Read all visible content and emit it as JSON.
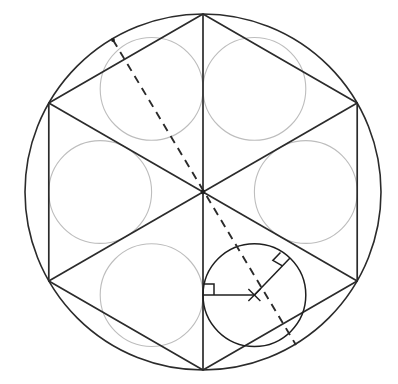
{
  "figure": {
    "domain": "Diagram",
    "canvas": {
      "width": 398,
      "height": 384,
      "background": "#ffffff"
    },
    "colors": {
      "primary_stroke": "#2b2b2b",
      "dark_stroke": "#1f1f1f",
      "light_circle_stroke": "#bdbdbd",
      "background": "#ffffff"
    }
  },
  "geometry": {
    "outer_circle": {
      "label": "outer circumscribed circle",
      "cx": 203,
      "cy": 192,
      "r": 178,
      "stroke": "#2b2b2b"
    },
    "hexagon": {
      "label": "regular hexagon inscribed in outer circle",
      "sides": 6,
      "rotation_deg": 90,
      "vertices": [
        {
          "name": "top",
          "x": 203,
          "y": 14
        },
        {
          "name": "upper-right",
          "x": 357.2,
          "y": 103
        },
        {
          "name": "lower-right",
          "x": 357.2,
          "y": 281
        },
        {
          "name": "bottom",
          "x": 203,
          "y": 370
        },
        {
          "name": "lower-left",
          "x": 48.8,
          "y": 281
        },
        {
          "name": "upper-left",
          "x": 48.8,
          "y": 103
        }
      ]
    },
    "diameters": {
      "label": "three long diagonals of hexagon meeting at center",
      "count": 3,
      "center": {
        "x": 203,
        "y": 192
      },
      "lines": [
        {
          "name": "vertical-diameter",
          "x1": 203,
          "y1": 14,
          "x2": 203,
          "y2": 370
        },
        {
          "name": "diagonal-upper-left-to-lower-right",
          "x1": 48.8,
          "y1": 103,
          "x2": 357.2,
          "y2": 281
        },
        {
          "name": "diagonal-upper-right-to-lower-left",
          "x1": 357.2,
          "y1": 103,
          "x2": 48.8,
          "y2": 281
        }
      ]
    },
    "inscribed_circles": {
      "label": "six circles inscribed in the six equilateral triangles",
      "count": 6,
      "radius": 51.4,
      "circles": [
        {
          "name": "circle-top-left",
          "cx": 151.6,
          "cy": 88.9,
          "highlight": false
        },
        {
          "name": "circle-top-right",
          "cx": 254.4,
          "cy": 88.9,
          "highlight": false
        },
        {
          "name": "circle-right",
          "cx": 305.8,
          "cy": 192,
          "highlight": false
        },
        {
          "name": "circle-bottom-right",
          "cx": 254.4,
          "cy": 295.1,
          "highlight": true
        },
        {
          "name": "circle-bottom-left",
          "cx": 151.6,
          "cy": 295.1,
          "highlight": false
        },
        {
          "name": "circle-left",
          "cx": 100.2,
          "cy": 192,
          "highlight": false
        }
      ]
    },
    "dashed_line": {
      "label": "dashed line from upper-left arc point through center to lower-right arc point",
      "x1": 113,
      "y1": 40,
      "x2": 296,
      "y2": 345,
      "dasharray": "8 6"
    },
    "radii": [
      {
        "name": "radius-horizontal-to-vertical-diameter",
        "from": {
          "x": 254.4,
          "y": 295.1
        },
        "to": {
          "x": 203,
          "y": 295.1
        },
        "note": "perpendicular to vertical diameter"
      },
      {
        "name": "radius-to-tangent-point-on-hexagon-side",
        "from": {
          "x": 254.4,
          "y": 295.1
        },
        "to": {
          "x": 290,
          "y": 258
        },
        "note": "perpendicular to hexagon diagonal at tangency"
      }
    ],
    "right_angle_marks": [
      {
        "name": "right-angle-at-vertical-diameter",
        "vertex": {
          "x": 203,
          "y": 295.1
        },
        "size": 11,
        "dir1": {
          "dx": 1,
          "dy": 0
        },
        "dir2": {
          "dx": 0,
          "dy": -1
        }
      },
      {
        "name": "right-angle-at-tangent-point",
        "vertex": {
          "x": 290,
          "y": 258
        },
        "size": 11,
        "dir1": {
          "dx": -0.693,
          "dy": 0.721
        },
        "dir2": {
          "dx": -0.866,
          "dy": -0.5
        }
      }
    ],
    "center_tick": {
      "name": "inscribed-circle-center-mark",
      "cx": 254.4,
      "cy": 295.1,
      "arm": 6
    },
    "vertex_dots": [
      {
        "name": "dot-figure-center",
        "x": 203,
        "y": 192,
        "r": 2.4
      },
      {
        "name": "dot-dashed-start",
        "x": 113,
        "y": 40,
        "r": 1.9
      }
    ]
  }
}
